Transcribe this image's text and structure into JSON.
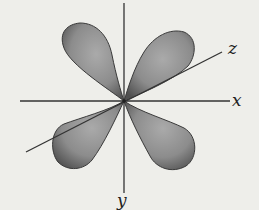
{
  "diagram": {
    "axes": [
      {
        "name": "x",
        "label": "x"
      },
      {
        "name": "y",
        "label": "y"
      },
      {
        "name": "z",
        "label": "z"
      }
    ],
    "lobes": [
      "upper-left",
      "upper-right",
      "lower-left",
      "lower-right"
    ],
    "colors": {
      "background": "#eeeeea",
      "axis": "#333333",
      "lobe_fill_center": "#a8a8a8",
      "lobe_fill_edge": "#555555"
    }
  }
}
